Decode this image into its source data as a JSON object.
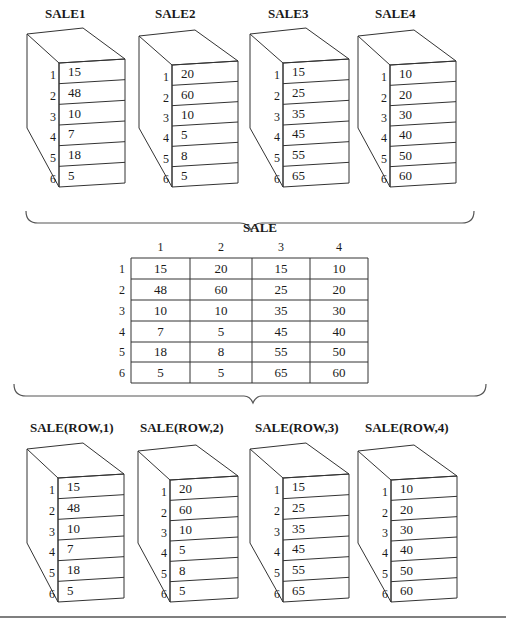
{
  "top_arrays": [
    {
      "label": "SALE1",
      "values": [
        "15",
        "48",
        "10",
        "7",
        "18",
        "5"
      ]
    },
    {
      "label": "SALE2",
      "values": [
        "20",
        "60",
        "10",
        "5",
        "8",
        "5"
      ]
    },
    {
      "label": "SALE3",
      "values": [
        "15",
        "25",
        "35",
        "45",
        "55",
        "65"
      ]
    },
    {
      "label": "SALE4",
      "values": [
        "10",
        "20",
        "30",
        "40",
        "50",
        "60"
      ]
    }
  ],
  "row_indices": [
    "1",
    "2",
    "3",
    "4",
    "5",
    "6"
  ],
  "matrix": {
    "title": "SALE",
    "column_headers": [
      "1",
      "2",
      "3",
      "4"
    ],
    "row_headers": [
      "1",
      "2",
      "3",
      "4",
      "5",
      "6"
    ],
    "rows": [
      [
        "15",
        "20",
        "15",
        "10"
      ],
      [
        "48",
        "60",
        "25",
        "20"
      ],
      [
        "10",
        "10",
        "35",
        "30"
      ],
      [
        "7",
        "5",
        "45",
        "40"
      ],
      [
        "18",
        "8",
        "55",
        "50"
      ],
      [
        "5",
        "5",
        "65",
        "60"
      ]
    ]
  },
  "bottom_arrays": [
    {
      "label": "SALE(ROW,1)",
      "values": [
        "15",
        "48",
        "10",
        "7",
        "18",
        "5"
      ]
    },
    {
      "label": "SALE(ROW,2)",
      "values": [
        "20",
        "60",
        "10",
        "5",
        "8",
        "5"
      ]
    },
    {
      "label": "SALE(ROW,3)",
      "values": [
        "15",
        "25",
        "35",
        "45",
        "55",
        "65"
      ]
    },
    {
      "label": "SALE(ROW,4)",
      "values": [
        "10",
        "20",
        "30",
        "40",
        "50",
        "60"
      ]
    }
  ]
}
